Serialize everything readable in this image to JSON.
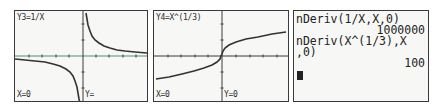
{
  "colors": {
    "screen_bg": "#f7f8f5",
    "border": "#3a3a3a",
    "text": "#222222",
    "axis_x_graph1": "#4f8f6f",
    "axis": "#3a3a3a",
    "curve": "#333333"
  },
  "graph1": {
    "function_label": "Y3=1/X",
    "x_readout": "X=0",
    "y_readout": "Y="
  },
  "graph2": {
    "function_label": "Y4=X^(1/3)",
    "x_readout": "X=0",
    "y_readout": "Y=0"
  },
  "home_screen": {
    "entries": [
      {
        "input": "nDeriv(1/X,X,0)",
        "result": "1000000"
      },
      {
        "input_line1": "nDeriv(X^(1/3),X",
        "input_line2": ",0)",
        "result": "100"
      }
    ],
    "cursor": "block-cursor"
  }
}
